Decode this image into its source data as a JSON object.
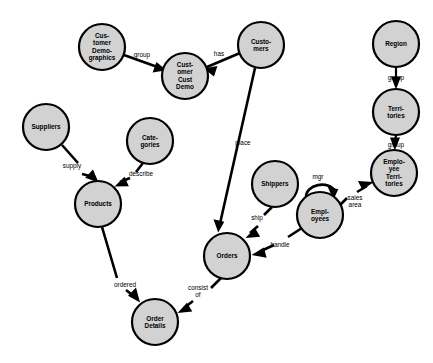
{
  "diagram": {
    "type": "entity-relationship-graph",
    "background_color": "#ffffff",
    "node_fill_color": "#d2d2d2",
    "node_stroke_color": "#000000",
    "edge_color": "#000000",
    "node_radius": 23,
    "nodes": [
      {
        "id": "customer_demographics",
        "label": "Cus-\ntomer\nDemo-\ngraphics",
        "x": 102,
        "y": 47
      },
      {
        "id": "customer_cust_demo",
        "label": "Cust-\nomer\nCust\nDemo",
        "x": 185,
        "y": 76
      },
      {
        "id": "customers",
        "label": "Custo-\nmers",
        "x": 261,
        "y": 45
      },
      {
        "id": "region",
        "label": "Region",
        "x": 396,
        "y": 44
      },
      {
        "id": "territories",
        "label": "Terri-\ntories",
        "x": 396,
        "y": 112
      },
      {
        "id": "employee_territories",
        "label": "Emplo-\nyee\nTerri-\ntories",
        "x": 394,
        "y": 173
      },
      {
        "id": "suppliers",
        "label": "Suppliers",
        "x": 46,
        "y": 127
      },
      {
        "id": "categories",
        "label": "Cate-\ngories",
        "x": 150,
        "y": 141
      },
      {
        "id": "products",
        "label": "Products",
        "x": 98,
        "y": 204
      },
      {
        "id": "shippers",
        "label": "Shippers",
        "x": 275,
        "y": 184
      },
      {
        "id": "employees",
        "label": "Empl-\noyees",
        "x": 320,
        "y": 215
      },
      {
        "id": "orders",
        "label": "Orders",
        "x": 227,
        "y": 256
      },
      {
        "id": "order_details",
        "label": "Order\nDetails",
        "x": 155,
        "y": 322
      }
    ],
    "edges": [
      {
        "id": "e_group_ccd",
        "from": "customer_demographics",
        "to": "customer_cust_demo",
        "label": "group",
        "label_x": 142,
        "label_y": 55
      },
      {
        "id": "e_has",
        "from": "customers",
        "to": "customer_cust_demo",
        "label": "has",
        "label_x": 219,
        "label_y": 54
      },
      {
        "id": "e_place",
        "from": "customers",
        "to": "orders",
        "label": "place",
        "label_x": 243,
        "label_y": 143
      },
      {
        "id": "e_group_terr",
        "from": "region",
        "to": "territories",
        "label": "group",
        "label_x": 396,
        "label_y": 78
      },
      {
        "id": "e_group_empterr",
        "from": "territories",
        "to": "employee_territories",
        "label": "group",
        "label_x": 396,
        "label_y": 145
      },
      {
        "id": "e_supply",
        "from": "suppliers",
        "to": "products",
        "label": "supply",
        "label_x": 72,
        "y_hint": 0,
        "label_y": 166
      },
      {
        "id": "e_describe",
        "from": "categories",
        "to": "products",
        "label": "describe",
        "label_x": 141,
        "label_y": 174
      },
      {
        "id": "e_ordered",
        "from": "products",
        "to": "order_details",
        "label": "ordered",
        "label_x": 125,
        "label_y": 285
      },
      {
        "id": "e_ship",
        "from": "shippers",
        "to": "orders",
        "label": "ship",
        "label_x": 257,
        "label_y": 218
      },
      {
        "id": "e_handle",
        "from": "employees",
        "to": "orders",
        "label": "handle",
        "label_x": 280,
        "label_y": 245
      },
      {
        "id": "e_mgr",
        "from": "employees",
        "to": "employees",
        "label": "mgr",
        "label_x": 318,
        "label_y": 177
      },
      {
        "id": "e_sales_area",
        "from": "employees",
        "to": "employee_territories",
        "label": "sales\narea",
        "label_x": 355,
        "label_y": 201
      },
      {
        "id": "e_consist_of",
        "from": "orders",
        "to": "order_details",
        "label": "consist\nof",
        "label_x": 198,
        "label_y": 291
      }
    ]
  }
}
